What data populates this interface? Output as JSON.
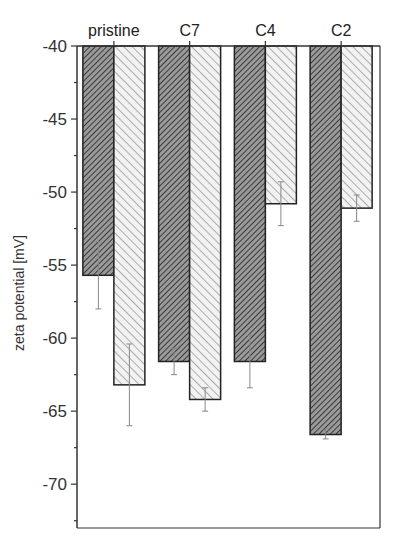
{
  "chart_data": {
    "type": "bar",
    "title": "",
    "xlabel": "",
    "ylabel": "zeta potential [mV]",
    "categories": [
      "pristine",
      "C7",
      "C4",
      "C2"
    ],
    "x_axis_position": "top",
    "ylim": [
      -73,
      -40
    ],
    "yticks": [
      -40,
      -45,
      -50,
      -55,
      -60,
      -65,
      -70
    ],
    "grid": false,
    "legend": null,
    "series": [
      {
        "name": "series 1 (dark hatch)",
        "pattern": "dense-dark-hatch",
        "values": [
          -55.7,
          -61.6,
          -61.6,
          -66.6
        ],
        "error": [
          2.3,
          0.9,
          1.8,
          0.3
        ]
      },
      {
        "name": "series 2 (light hatch)",
        "pattern": "light-hatch",
        "values": [
          -63.2,
          -64.2,
          -50.8,
          -51.1
        ],
        "error": [
          2.8,
          0.8,
          1.5,
          0.9
        ]
      }
    ]
  },
  "colors": {
    "axis": "#333333",
    "dark_fill": "#7a7a7a",
    "light_fill": "#e8e8e8",
    "error_bar": "#888888"
  }
}
